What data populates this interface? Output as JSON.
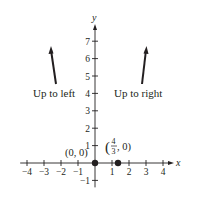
{
  "chart_data": {
    "type": "scatter",
    "title": "",
    "xlabel": "x",
    "ylabel": "y",
    "xlim": [
      -4.4,
      4.8
    ],
    "ylim": [
      -1.4,
      7.6
    ],
    "x_ticks": [
      -4,
      -3,
      -2,
      -1,
      1,
      2,
      3,
      4
    ],
    "x_tick_labels": [
      "−4",
      "−3",
      "−2",
      "−1",
      "1",
      "2",
      "3",
      "4"
    ],
    "y_ticks": [
      -1,
      1,
      2,
      3,
      4,
      5,
      6,
      7
    ],
    "y_tick_labels": [
      "−1",
      "1",
      "2",
      "3",
      "4",
      "5",
      "6",
      "7"
    ],
    "grid": false,
    "points": [
      {
        "x": 0,
        "y": 0,
        "label": "(0, 0)"
      },
      {
        "x": 1.3333,
        "y": 0,
        "label": "(4/3, 0)"
      }
    ],
    "annotations": [
      {
        "text": "Up to left",
        "arrow_from": [
          -2.4,
          4.5
        ],
        "arrow_to": [
          -2.7,
          6.9
        ]
      },
      {
        "text": "Up to right",
        "arrow_from": [
          2.3,
          4.5
        ],
        "arrow_to": [
          2.55,
          6.9
        ]
      }
    ]
  },
  "labels": {
    "x_axis": "x",
    "y_axis": "y",
    "origin_point": "(0, 0)",
    "point2_num": "4",
    "point2_den": "3",
    "point2_rest": ", 0)",
    "point2_open": "(",
    "left_note": "Up to left",
    "right_note": "Up to right"
  }
}
